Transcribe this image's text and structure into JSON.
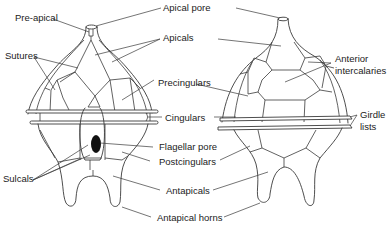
{
  "figure": {
    "views": [
      "ventral",
      "dorsal"
    ],
    "colors": {
      "line": "#3a3a3a",
      "text": "#222222",
      "flagellar_pore": "#111111",
      "background": "#ffffff"
    }
  },
  "labels": {
    "pre_apical": "Pre-apical",
    "apical_pore": "Apical pore",
    "apicals": "Apicals",
    "sutures": "Sutures",
    "precingulars": "Precingulars",
    "anterior_intercalaries_1": "Anterior",
    "anterior_intercalaries_2": "intercalaries",
    "cingulars": "Cingulars",
    "girdle_lists_1": "Girdle",
    "girdle_lists_2": "lists",
    "flagellar_pore": "Flagellar pore",
    "sulcals": "Sulcals",
    "postcingulars": "Postcingulars",
    "antapicals": "Antapicals",
    "antapical_horns": "Antapical horns"
  }
}
